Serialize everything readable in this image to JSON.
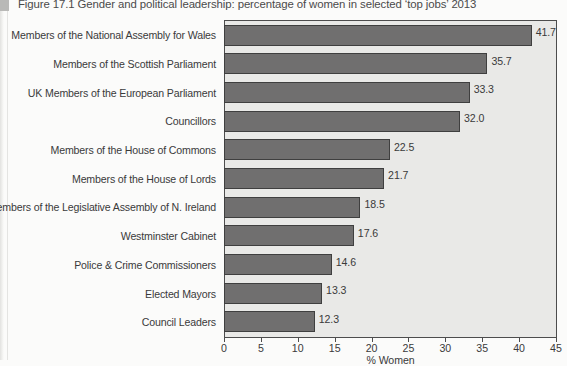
{
  "figure": {
    "caption": "Figure 17.1  Gender and political leadership: percentage of women in selected ‘top jobs’ 2013"
  },
  "colors": {
    "bar_fill": "#706f6f",
    "bar_stroke": "#3f3f3f",
    "plot_background": "#e9e9e7",
    "axis": "#4d4d4d",
    "text": "#3a3a3a",
    "page_background": "#fbfbfa"
  },
  "chart_data": {
    "type": "bar",
    "orientation": "horizontal",
    "title": "Figure 17.1  Gender and political leadership: percentage of women in selected ‘top jobs’ 2013",
    "xlabel": "% Women",
    "ylabel": "",
    "xlim": [
      0,
      45
    ],
    "xticks": [
      0,
      5,
      10,
      15,
      20,
      25,
      30,
      35,
      40,
      45
    ],
    "xtick_labels": [
      "0",
      "5",
      "10",
      "15",
      "20",
      "25",
      "30",
      "35",
      "40",
      "45"
    ],
    "grid": false,
    "legend": false,
    "categories": [
      "Members of the National Assembly for Wales",
      "Members of the Scottish Parliament",
      "UK Members of the European Parliament",
      "Councillors",
      "Members of the House of Commons",
      "Members of the House of Lords",
      "Members of the Legislative Assembly of N. Ireland",
      "Westminster Cabinet",
      "Police & Crime Commissioners",
      "Elected Mayors",
      "Council Leaders"
    ],
    "values": [
      41.7,
      35.7,
      33.3,
      32.0,
      22.5,
      21.7,
      18.5,
      17.6,
      14.6,
      13.3,
      12.3
    ],
    "value_labels": [
      "41.7",
      "35.7",
      "33.3",
      "32.0",
      "22.5",
      "21.7",
      "18.5",
      "17.6",
      "14.6",
      "13.3",
      "12.3"
    ]
  }
}
